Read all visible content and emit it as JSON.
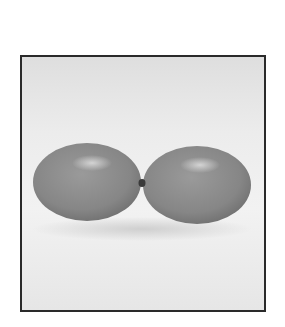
{
  "photo": {
    "subject": "two balloons tied together",
    "colors": {
      "background": "#ffffff",
      "frame_border": "#2a2a2a",
      "backdrop": "#ececec",
      "balloon": "#8a8a8a",
      "balloon_highlight": "#c8c8c8",
      "knot": "#3a3a3a"
    }
  }
}
